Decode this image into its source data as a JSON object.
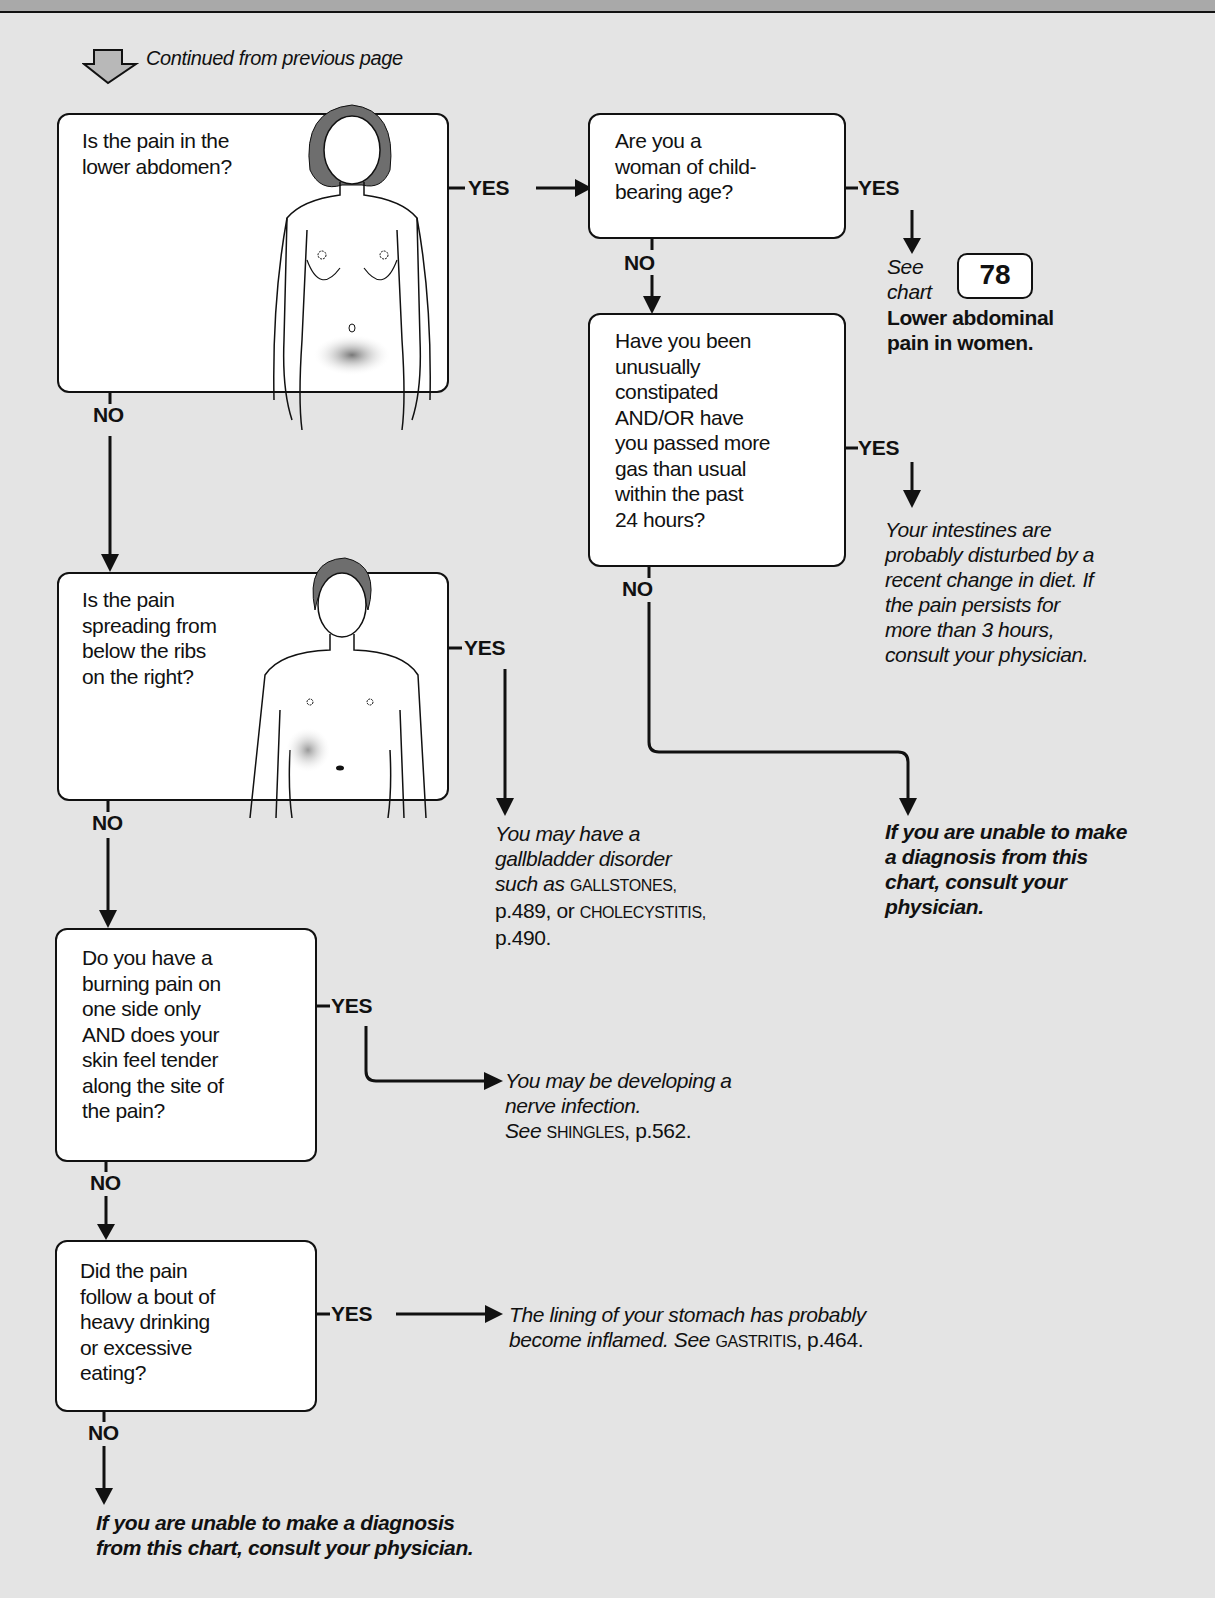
{
  "header": {
    "continued_label": "Continued from previous page",
    "continued_icon": "hollow-down-arrow-icon"
  },
  "colors": {
    "background": "#e4e4e4",
    "top_band": "#a9a9a9",
    "box_fill": "#ffffff",
    "stroke": "#111111"
  },
  "labels": {
    "yes": "YES",
    "no": "NO"
  },
  "questions": [
    {
      "id": "q1",
      "lines": [
        "Is the pain in the",
        "lower abdomen?"
      ],
      "illustration": "female-figure-lower-abdomen-shaded"
    },
    {
      "id": "q2",
      "lines": [
        "Are you a",
        "woman of child-",
        "bearing age?"
      ]
    },
    {
      "id": "q3",
      "lines": [
        "Have you been",
        "unusually",
        "constipated",
        "AND/OR have",
        "you passed more",
        "gas than usual",
        "within the past",
        "24 hours?"
      ]
    },
    {
      "id": "q4",
      "lines": [
        "Is the pain",
        "spreading from",
        "below the ribs",
        "on the right?"
      ],
      "illustration": "male-figure-right-upper-abdomen-shaded"
    },
    {
      "id": "q5",
      "lines": [
        "Do you have a",
        "burning pain on",
        "one side only",
        "AND does your",
        "skin feel tender",
        "along the site of",
        "the pain?"
      ]
    },
    {
      "id": "q6",
      "lines": [
        "Did the pain",
        "follow a bout of",
        "heavy drinking",
        "or excessive",
        "eating?"
      ]
    }
  ],
  "outcomes": {
    "see_chart": {
      "see": "See",
      "chart": "chart",
      "number": "78",
      "title_lines": [
        "Lower abdominal",
        "pain in women."
      ]
    },
    "intestines": {
      "lines": [
        "Your intestines are",
        "probably disturbed by a",
        "recent change in diet. If",
        "the pain persists for",
        "more than 3 hours,",
        "consult your physician."
      ]
    },
    "unable_right": {
      "lines": [
        "If you are unable to make",
        "a diagnosis from this",
        "chart, consult your",
        "physician."
      ]
    },
    "gallbladder": {
      "line1": "You may have a",
      "line2": "gallbladder disorder",
      "line3_it": "such as ",
      "line3_sc": "GALLSTONES,",
      "line4_a": "p.489, or ",
      "line4_sc": "CHOLECYSTITIS,",
      "line5": "p.490."
    },
    "shingles": {
      "line1": "You may be developing a",
      "line2": "nerve infection.",
      "line3_it": "See ",
      "line3_sc": "SHINGLES",
      "line3_end": ", p.562."
    },
    "gastritis": {
      "line1": "The lining of your stomach has probably",
      "line2_it": "become inflamed. See ",
      "line2_sc": "GASTRITIS",
      "line2_end": ", p.464."
    },
    "unable_bottom": {
      "lines": [
        "If you are unable to make a diagnosis",
        "from this chart, consult your physician."
      ]
    }
  }
}
